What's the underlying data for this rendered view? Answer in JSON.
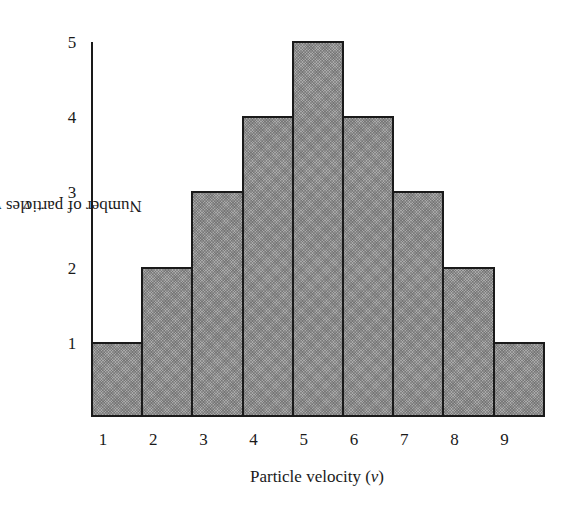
{
  "chart_data": {
    "type": "bar",
    "title": "",
    "categories": [
      "1",
      "2",
      "3",
      "4",
      "5",
      "6",
      "7",
      "8",
      "9"
    ],
    "values": [
      1,
      2,
      3,
      4,
      5,
      4,
      3,
      2,
      1
    ],
    "xlabel": "Particle velocity (v)",
    "ylabel": "Number of particles with velocity v",
    "yticks": [
      "1",
      "2",
      "3",
      "4",
      "5"
    ],
    "ylim": [
      0,
      5
    ],
    "grid": false,
    "legend": null,
    "style": {
      "bar_fill": "#a9a9a9",
      "bar_edge": "#1a1a1a",
      "bar_pattern": "crosshatch-dots",
      "histogram": true
    }
  },
  "labels": {
    "xlabel_prefix": "Particle velocity (",
    "xlabel_var": "v",
    "xlabel_suffix": ")",
    "ylabel_prefix": "Number of particles with velocity ",
    "ylabel_var": "v"
  }
}
